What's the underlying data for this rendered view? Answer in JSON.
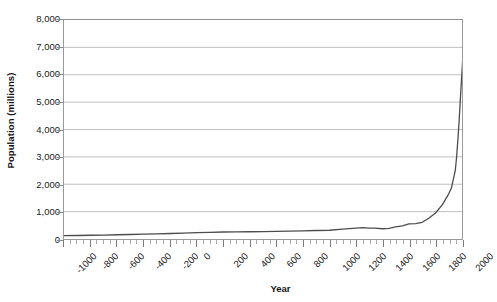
{
  "chart_data": {
    "type": "line",
    "title": "",
    "xlabel": "Year",
    "ylabel": "Population (millions)",
    "xlim": [
      -1000,
      2000
    ],
    "ylim": [
      0,
      8000
    ],
    "grid": true,
    "legend": "none",
    "series": [
      {
        "name": "World population",
        "color": "#4d4d4d",
        "points": [
          {
            "x": -1000,
            "y": 120
          },
          {
            "x": -900,
            "y": 128
          },
          {
            "x": -800,
            "y": 136
          },
          {
            "x": -700,
            "y": 145
          },
          {
            "x": -600,
            "y": 155
          },
          {
            "x": -500,
            "y": 165
          },
          {
            "x": -400,
            "y": 178
          },
          {
            "x": -300,
            "y": 190
          },
          {
            "x": -200,
            "y": 200
          },
          {
            "x": -100,
            "y": 215
          },
          {
            "x": 0,
            "y": 230
          },
          {
            "x": 100,
            "y": 245
          },
          {
            "x": 200,
            "y": 255
          },
          {
            "x": 300,
            "y": 260
          },
          {
            "x": 400,
            "y": 265
          },
          {
            "x": 500,
            "y": 270
          },
          {
            "x": 600,
            "y": 280
          },
          {
            "x": 700,
            "y": 290
          },
          {
            "x": 800,
            "y": 300
          },
          {
            "x": 900,
            "y": 310
          },
          {
            "x": 1000,
            "y": 320
          },
          {
            "x": 1100,
            "y": 360
          },
          {
            "x": 1200,
            "y": 400
          },
          {
            "x": 1250,
            "y": 416
          },
          {
            "x": 1300,
            "y": 400
          },
          {
            "x": 1340,
            "y": 395
          },
          {
            "x": 1400,
            "y": 375
          },
          {
            "x": 1450,
            "y": 390
          },
          {
            "x": 1500,
            "y": 440
          },
          {
            "x": 1550,
            "y": 480
          },
          {
            "x": 1600,
            "y": 550
          },
          {
            "x": 1650,
            "y": 560
          },
          {
            "x": 1700,
            "y": 610
          },
          {
            "x": 1750,
            "y": 760
          },
          {
            "x": 1800,
            "y": 950
          },
          {
            "x": 1850,
            "y": 1240
          },
          {
            "x": 1900,
            "y": 1650
          },
          {
            "x": 1920,
            "y": 1860
          },
          {
            "x": 1940,
            "y": 2300
          },
          {
            "x": 1950,
            "y": 2530
          },
          {
            "x": 1960,
            "y": 3030
          },
          {
            "x": 1970,
            "y": 3700
          },
          {
            "x": 1980,
            "y": 4440
          },
          {
            "x": 1990,
            "y": 5320
          },
          {
            "x": 2000,
            "y": 6120
          },
          {
            "x": 2010,
            "y": 6930
          },
          {
            "x": 2012,
            "y": 7050
          }
        ]
      }
    ],
    "y_ticks": [
      {
        "value": 0,
        "label": "0"
      },
      {
        "value": 1000,
        "label": "1,000"
      },
      {
        "value": 2000,
        "label": "2,000"
      },
      {
        "value": 3000,
        "label": "3,000"
      },
      {
        "value": 4000,
        "label": "4,000"
      },
      {
        "value": 5000,
        "label": "5,000"
      },
      {
        "value": 6000,
        "label": "6,000"
      },
      {
        "value": 7000,
        "label": "7,000"
      },
      {
        "value": 8000,
        "label": "8,000"
      }
    ],
    "x_ticks": [
      {
        "value": -1000,
        "label": "-1000"
      },
      {
        "value": -800,
        "label": "-800"
      },
      {
        "value": -600,
        "label": "-600"
      },
      {
        "value": -400,
        "label": "-400"
      },
      {
        "value": -200,
        "label": "-200"
      },
      {
        "value": 0,
        "label": "0"
      },
      {
        "value": 200,
        "label": "200"
      },
      {
        "value": 400,
        "label": "400"
      },
      {
        "value": 600,
        "label": "600"
      },
      {
        "value": 800,
        "label": "800"
      },
      {
        "value": 1000,
        "label": "1000"
      },
      {
        "value": 1200,
        "label": "1200"
      },
      {
        "value": 1400,
        "label": "1400"
      },
      {
        "value": 1600,
        "label": "1600"
      },
      {
        "value": 1800,
        "label": "1800"
      },
      {
        "value": 2000,
        "label": "2000"
      }
    ],
    "x_minor_step": 50,
    "colors": {
      "line": "#4d4d4d",
      "gridline": "#bfbfbf",
      "axis": "#8a8a8a",
      "plot_border": "#9a9a9a",
      "background": "#ffffff",
      "text": "#1a1a1a"
    }
  }
}
